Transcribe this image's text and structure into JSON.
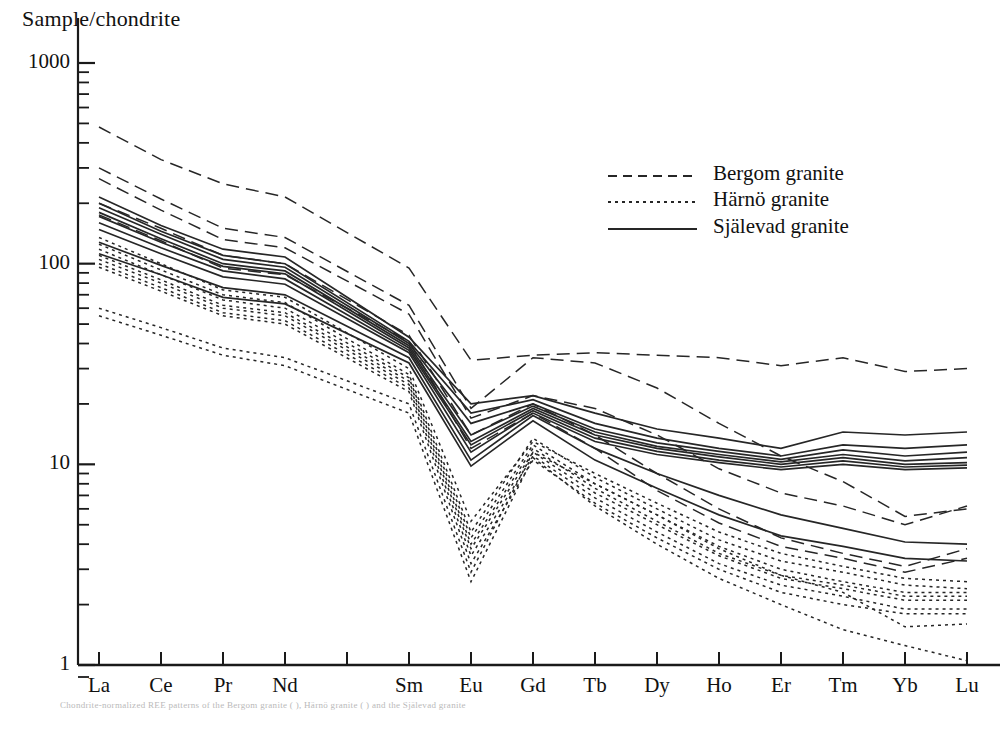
{
  "figure": {
    "y_axis_title": "Sample/chondrite",
    "y_ticks": [
      "1000",
      "100",
      "10",
      "1"
    ],
    "x_ticks": [
      "La",
      "Ce",
      "Pr",
      "Nd",
      "Sm",
      "Eu",
      "Gd",
      "Tb",
      "Dy",
      "Ho",
      "Er",
      "Tm",
      "Yb",
      "Lu"
    ],
    "legend": [
      {
        "label": "Bergom granite",
        "style": "dashed"
      },
      {
        "label": "Härnö granite",
        "style": "dotted"
      },
      {
        "label": "Själevad granite",
        "style": "solid"
      }
    ],
    "axis_color": "#1a1a1a",
    "line_color": "#262626",
    "background": "#ffffff",
    "bleed_text": "Chondrite-normalized REE patterns of the Bergom granite ( ), Härnö granite ( ) and the Själevad granite"
  },
  "chart_data": {
    "type": "line",
    "title": "",
    "xlabel": "",
    "ylabel": "Sample/chondrite",
    "ylim": [
      1,
      1000
    ],
    "yscale": "log",
    "grid": false,
    "legend_position": "upper-right",
    "categories": [
      "La",
      "Ce",
      "Pr",
      "Nd",
      "Sm",
      "Eu",
      "Gd",
      "Tb",
      "Dy",
      "Ho",
      "Er",
      "Tm",
      "Yb",
      "Lu"
    ],
    "category_slots": [
      0,
      1,
      2,
      3,
      5,
      6,
      7,
      8,
      9,
      10,
      11,
      12,
      13,
      14
    ],
    "n_slots": 15,
    "series": [
      {
        "name": "Bergom granite",
        "style": "dashed",
        "values": [
          480,
          330,
          250,
          215,
          95,
          33,
          35,
          36,
          35,
          34,
          31,
          34,
          29,
          30
        ]
      },
      {
        "name": "Bergom granite",
        "style": "dashed",
        "values": [
          300,
          210,
          150,
          135,
          62,
          19,
          34,
          32,
          24,
          16,
          11,
          8.2,
          5.5,
          6.0
        ]
      },
      {
        "name": "Bergom granite",
        "style": "dashed",
        "values": [
          265,
          185,
          132,
          120,
          56,
          17,
          22,
          19,
          14,
          9.5,
          7.2,
          6.2,
          5.0,
          6.2
        ]
      },
      {
        "name": "Bergom granite",
        "style": "dashed",
        "values": [
          200,
          150,
          110,
          100,
          44,
          14,
          20,
          14,
          9.0,
          6.0,
          4.3,
          3.6,
          3.1,
          3.8
        ]
      },
      {
        "name": "Bergom granite",
        "style": "dashed",
        "values": [
          175,
          130,
          95,
          88,
          41,
          12,
          18,
          12,
          7.4,
          5.1,
          3.9,
          3.4,
          2.9,
          3.4
        ]
      },
      {
        "name": "Själevad granite",
        "style": "solid",
        "values": [
          215,
          155,
          118,
          108,
          43,
          20,
          22,
          18,
          15,
          13.5,
          12.0,
          14.5,
          14.0,
          14.5
        ]
      },
      {
        "name": "Själevad granite",
        "style": "solid",
        "values": [
          200,
          145,
          110,
          100,
          41,
          18,
          21,
          16,
          13.5,
          12.0,
          11.0,
          12.5,
          12.0,
          12.5
        ]
      },
      {
        "name": "Själevad granite",
        "style": "solid",
        "values": [
          190,
          140,
          105,
          96,
          40,
          16,
          20,
          15,
          12.8,
          11.6,
          10.6,
          11.8,
          11.0,
          11.5
        ]
      },
      {
        "name": "Själevad granite",
        "style": "solid",
        "values": [
          180,
          133,
          100,
          92,
          39,
          14,
          19.5,
          14.5,
          12.3,
          11.2,
          10.3,
          11.2,
          10.4,
          10.8
        ]
      },
      {
        "name": "Själevad granite",
        "style": "solid",
        "values": [
          172,
          128,
          97,
          89,
          38,
          13,
          19,
          14.0,
          12.0,
          10.9,
          10.0,
          10.8,
          10.0,
          10.2
        ]
      },
      {
        "name": "Själevad granite",
        "style": "solid",
        "values": [
          160,
          120,
          92,
          84,
          37,
          12.5,
          18.5,
          13.5,
          11.6,
          10.5,
          9.7,
          10.4,
          9.7,
          9.9
        ]
      },
      {
        "name": "Själevad granite",
        "style": "solid",
        "values": [
          148,
          112,
          86,
          79,
          36,
          11.5,
          18,
          13.0,
          11.2,
          10.2,
          9.4,
          10.0,
          9.4,
          9.6
        ]
      },
      {
        "name": "Själevad granite",
        "style": "solid",
        "values": [
          128,
          98,
          76,
          70,
          34,
          10.5,
          17.5,
          12.0,
          9.0,
          7.0,
          5.6,
          4.8,
          4.1,
          4.0
        ]
      },
      {
        "name": "Själevad granite",
        "style": "solid",
        "values": [
          112,
          88,
          68,
          63,
          32,
          9.8,
          16.5,
          10.5,
          7.6,
          5.6,
          4.4,
          3.9,
          3.4,
          3.3
        ]
      },
      {
        "name": "Härnö granite",
        "style": "dotted",
        "values": [
          135,
          100,
          74,
          68,
          30,
          5.2,
          13.0,
          9.0,
          6.4,
          4.6,
          3.6,
          3.1,
          2.7,
          2.6
        ]
      },
      {
        "name": "Härnö granite",
        "style": "dotted",
        "values": [
          125,
          93,
          70,
          64,
          28,
          4.6,
          13.5,
          8.6,
          6.0,
          4.2,
          3.3,
          2.9,
          2.5,
          2.4
        ]
      },
      {
        "name": "Härnö granite",
        "style": "dotted",
        "values": [
          118,
          88,
          66,
          60,
          27,
          4.3,
          12.5,
          8.0,
          5.6,
          3.9,
          3.0,
          2.6,
          2.3,
          2.3
        ]
      },
      {
        "name": "Härnö granite",
        "style": "dotted",
        "values": [
          110,
          83,
          62,
          57,
          26,
          4.0,
          12.0,
          7.6,
          5.2,
          3.6,
          2.8,
          2.5,
          2.2,
          2.2
        ]
      },
      {
        "name": "Härnö granite",
        "style": "dotted",
        "values": [
          105,
          80,
          60,
          55,
          25,
          3.8,
          11.5,
          7.2,
          5.0,
          3.5,
          2.7,
          2.4,
          2.1,
          2.1
        ]
      },
      {
        "name": "Härnö granite",
        "style": "dotted",
        "values": [
          100,
          76,
          57,
          52,
          24,
          3.5,
          11.0,
          6.8,
          4.6,
          3.2,
          2.5,
          2.2,
          1.9,
          1.9
        ]
      },
      {
        "name": "Härnö granite",
        "style": "dotted",
        "values": [
          96,
          73,
          55,
          50,
          23,
          3.2,
          10.5,
          6.4,
          4.3,
          3.0,
          2.3,
          2.0,
          1.8,
          1.8
        ]
      },
      {
        "name": "Härnö granite",
        "style": "dotted",
        "values": [
          60,
          48,
          38,
          34,
          20,
          2.9,
          11.5,
          8.0,
          5.6,
          3.8,
          2.8,
          2.3,
          1.55,
          1.6
        ]
      },
      {
        "name": "Härnö granite",
        "style": "dotted",
        "values": [
          55,
          44,
          35,
          31,
          18,
          2.6,
          10.8,
          6.2,
          4.0,
          2.7,
          2.0,
          1.5,
          1.25,
          1.05
        ]
      }
    ]
  }
}
